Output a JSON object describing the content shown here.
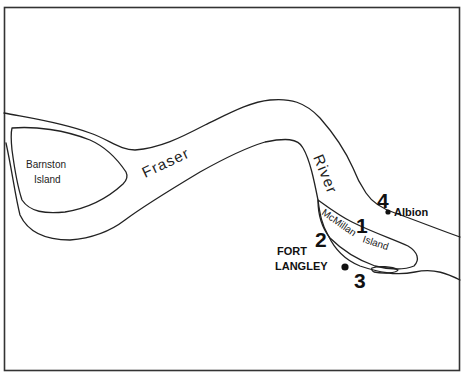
{
  "map": {
    "river_name_part1": "Fraser",
    "river_name_part2": "River",
    "islands": [
      {
        "name_line1": "Barnston",
        "name_line2": "Island"
      },
      {
        "name_line1": "McMillan",
        "name_line2": "Island"
      }
    ],
    "places": [
      {
        "name_line1": "FORT",
        "name_line2": "LANGLEY"
      },
      {
        "name": "Albion"
      }
    ],
    "site_markers": [
      "1",
      "2",
      "3",
      "4"
    ],
    "colors": {
      "ink": "#222222",
      "paper": "#ffffff"
    }
  }
}
